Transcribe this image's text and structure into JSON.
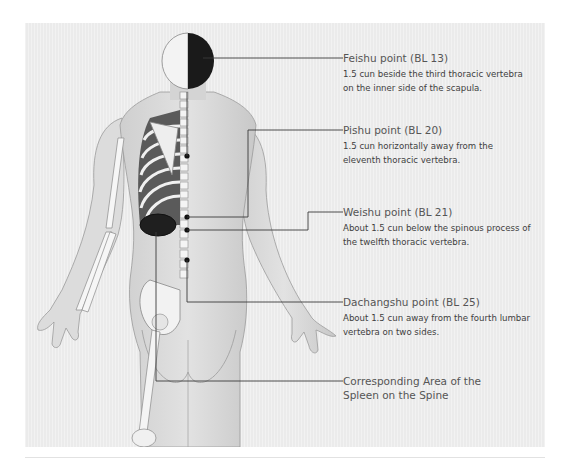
{
  "figure": {
    "colors": {
      "panel_bg": "#ebebeb",
      "leader_line": "#3a3a3a",
      "text": "#4a4a4a",
      "skin": "#d9d9d9",
      "bone": "#f5f5f5"
    }
  },
  "callouts": [
    {
      "title": "Feishu point (BL 13)",
      "description": "1.5 cun beside the third thoracic vertebra on the inner side of the scapula."
    },
    {
      "title": "Pishu point (BL 20)",
      "description": "1.5 cun horizontally away from the eleventh thoracic vertebra."
    },
    {
      "title": "Weishu point (BL 21)",
      "description": "About 1.5 cun below the spinous process of the twelfth thoracic vertebra."
    },
    {
      "title": "Dachangshu point (BL 25)",
      "description": "About 1.5 cun away from the fourth lumbar vertebra on two sides."
    },
    {
      "title": "Corresponding Area of the Spleen on the Spine",
      "description": ""
    }
  ]
}
